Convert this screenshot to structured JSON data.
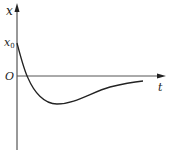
{
  "diagram": {
    "type": "damped-response-curve",
    "axes": {
      "vertical_label": "x",
      "horizontal_label": "t",
      "origin_label": "O",
      "initial_value_label": "x",
      "initial_value_subscript": "0"
    },
    "curve": {
      "description": "starts at x0, crosses t-axis, reaches a single minimum below axis, then approaches zero from below",
      "points": [
        [
          17,
          43
        ],
        [
          27,
          76
        ],
        [
          57,
          104
        ],
        [
          143,
          82
        ]
      ]
    },
    "colors": {
      "axis": "#333333",
      "curve": "#222222",
      "background": "#ffffff"
    }
  }
}
